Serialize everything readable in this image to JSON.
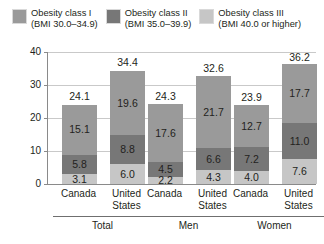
{
  "chart_data": {
    "type": "bar",
    "subtype": "stacked-bar",
    "title": "",
    "xlabel": "",
    "ylabel": "Percent",
    "ylim": [
      0,
      40
    ],
    "yticks": [
      0,
      10,
      20,
      30,
      40
    ],
    "ytick_labels": [
      "0",
      "10",
      "20",
      "30",
      "40"
    ],
    "grid": true,
    "legend_position": "top",
    "stack_order_bottom_to_top": [
      "Obesity class III",
      "Obesity class II",
      "Obesity class I"
    ],
    "legend": [
      {
        "name": "Obesity class I",
        "label_line1": "Obesity class I",
        "label_line2": "(BMI 30.0–34.9)",
        "color": "#9a9a9a"
      },
      {
        "name": "Obesity class II",
        "label_line1": "Obesity class II",
        "label_line2": "(BMI 35.0–39.9)",
        "color": "#777777"
      },
      {
        "name": "Obesity class III",
        "label_line1": "Obesity class III",
        "label_line2": "(BMI 40.0 or higher)",
        "color": "#c6c6c6"
      }
    ],
    "groups": [
      "Total",
      "Men",
      "Women"
    ],
    "categories": [
      "Canada",
      "United States",
      "Canada",
      "United States",
      "Canada",
      "United States"
    ],
    "series": [
      {
        "name": "Obesity class I",
        "values": [
          15.1,
          19.6,
          17.6,
          21.7,
          12.7,
          17.7
        ]
      },
      {
        "name": "Obesity class II",
        "values": [
          5.8,
          8.8,
          4.5,
          6.6,
          7.2,
          11.0
        ]
      },
      {
        "name": "Obesity class III",
        "values": [
          3.1,
          6.0,
          2.2,
          4.3,
          4.0,
          7.6
        ]
      }
    ],
    "totals": [
      24.1,
      34.4,
      24.3,
      32.6,
      23.9,
      36.2
    ],
    "bars": [
      {
        "group": "Total",
        "country_line1": "Canada",
        "country_line2": "",
        "total": "24.1",
        "segments": [
          {
            "series": "Obesity class III",
            "value": 3.1,
            "label": "3.1"
          },
          {
            "series": "Obesity class II",
            "value": 5.8,
            "label": "5.8"
          },
          {
            "series": "Obesity class I",
            "value": 15.1,
            "label": "15.1"
          }
        ]
      },
      {
        "group": "Total",
        "country_line1": "United",
        "country_line2": "States",
        "total": "34.4",
        "segments": [
          {
            "series": "Obesity class III",
            "value": 6.0,
            "label": "6.0"
          },
          {
            "series": "Obesity class II",
            "value": 8.8,
            "label": "8.8"
          },
          {
            "series": "Obesity class I",
            "value": 19.6,
            "label": "19.6"
          }
        ]
      },
      {
        "group": "Men",
        "country_line1": "Canada",
        "country_line2": "",
        "total": "24.3",
        "segments": [
          {
            "series": "Obesity class III",
            "value": 2.2,
            "label": "2.2"
          },
          {
            "series": "Obesity class II",
            "value": 4.5,
            "label": "4.5"
          },
          {
            "series": "Obesity class I",
            "value": 17.6,
            "label": "17.6"
          }
        ]
      },
      {
        "group": "Men",
        "country_line1": "United",
        "country_line2": "States",
        "total": "32.6",
        "segments": [
          {
            "series": "Obesity class III",
            "value": 4.3,
            "label": "4.3"
          },
          {
            "series": "Obesity class II",
            "value": 6.6,
            "label": "6.6"
          },
          {
            "series": "Obesity class I",
            "value": 21.7,
            "label": "21.7"
          }
        ]
      },
      {
        "group": "Women",
        "country_line1": "Canada",
        "country_line2": "",
        "total": "23.9",
        "segments": [
          {
            "series": "Obesity class III",
            "value": 4.0,
            "label": "4.0"
          },
          {
            "series": "Obesity class II",
            "value": 7.2,
            "label": "7.2"
          },
          {
            "series": "Obesity class I",
            "value": 12.7,
            "label": "12.7"
          }
        ]
      },
      {
        "group": "Women",
        "country_line1": "United",
        "country_line2": "States",
        "total": "36.2",
        "segments": [
          {
            "series": "Obesity class III",
            "value": 7.6,
            "label": "7.6"
          },
          {
            "series": "Obesity class II",
            "value": 11.0,
            "label": "11.0"
          },
          {
            "series": "Obesity class I",
            "value": 17.7,
            "label": "17.7"
          }
        ]
      }
    ]
  }
}
